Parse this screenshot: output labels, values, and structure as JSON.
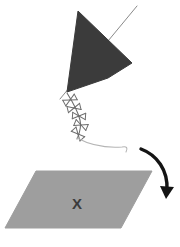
{
  "figure": {
    "caption": "",
    "background_color": "#ffffff",
    "width": 180,
    "height": 247
  },
  "colors": {
    "kite_fill": "#3b3b3b",
    "kite_stroke": "#3b3b3b",
    "ground_fill": "#9e9e9e",
    "ground_stroke": "#9e9e9e",
    "arrow": "#141414",
    "tail": "#6e6e6e",
    "string": "#b5b5b5",
    "spar": "#8a8a8a",
    "x_mark": "#3b3b3b"
  },
  "shapes": {
    "kite": {
      "name": "kite-body",
      "label": "",
      "points": "78,11 132,63 108,78 67,92",
      "fill": "#3b3b3b"
    },
    "spar": {
      "name": "kite-spar-line",
      "label": "",
      "points": "137,6 60,99",
      "color": "#8a8a8a"
    },
    "ground": {
      "name": "ground-plane",
      "label": "",
      "points": "36,171 152,171 121,228 5,228",
      "fill": "#9e9e9e"
    },
    "x_mark": {
      "name": "landing-spot-x",
      "label": "X",
      "x": 77,
      "y": 205,
      "color": "#3b3b3b"
    },
    "arrow": {
      "name": "motion-arrow",
      "label": "",
      "path": "M141,149 C157,155 168,170 167,190",
      "head": "160,186 174,187 166,199",
      "color": "#141414"
    },
    "string": {
      "name": "kite-string",
      "label": "",
      "path": "M77,138 C92,146 108,148 122,147 C127,146 128,148 126,152",
      "color": "#b5b5b5"
    },
    "tail": {
      "name": "kite-tail",
      "label": "",
      "path": "M67,93 C74,104 78,112 80,120 C82,128 79,134 77,139",
      "color": "#6e6e6e",
      "bows": [
        {
          "cx": 70,
          "cy": 100,
          "angle": -28
        },
        {
          "cx": 74,
          "cy": 108,
          "angle": -14
        },
        {
          "cx": 79,
          "cy": 116,
          "angle": 4
        },
        {
          "cx": 81,
          "cy": 125,
          "angle": 22
        },
        {
          "cx": 78,
          "cy": 134,
          "angle": 48
        }
      ]
    }
  }
}
